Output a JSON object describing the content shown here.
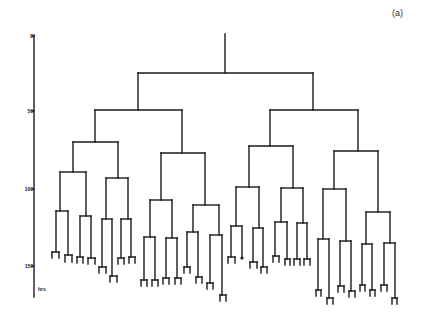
{
  "figure": {
    "panel_label": "(a)",
    "type": "dendrogram",
    "axis": {
      "unit_label": "hrs",
      "ticks": [
        {
          "label": "0",
          "y": 36
        },
        {
          "label": "50",
          "y": 111
        },
        {
          "label": "100",
          "y": 189
        },
        {
          "label": "150",
          "y": 266
        }
      ]
    },
    "line_color": "#1a1a1a",
    "segments": [
      [
        225,
        34,
        225,
        73
      ],
      [
        138,
        73,
        313,
        73
      ],
      [
        138,
        73,
        138,
        110
      ],
      [
        313,
        73,
        313,
        110
      ],
      [
        95,
        110,
        182,
        110
      ],
      [
        95,
        110,
        95,
        142
      ],
      [
        182,
        110,
        182,
        153
      ],
      [
        73,
        142,
        118,
        142
      ],
      [
        73,
        142,
        73,
        172
      ],
      [
        118,
        142,
        118,
        178
      ],
      [
        60,
        172,
        86,
        172
      ],
      [
        60,
        172,
        60,
        211
      ],
      [
        86,
        172,
        86,
        216
      ],
      [
        56,
        211,
        68,
        211
      ],
      [
        56,
        211,
        56,
        252
      ],
      [
        68,
        211,
        68,
        255
      ],
      [
        52,
        252,
        59,
        252
      ],
      [
        52,
        252,
        52,
        258
      ],
      [
        59,
        252,
        59,
        258
      ],
      [
        65,
        255,
        72,
        255
      ],
      [
        65,
        255,
        65,
        262
      ],
      [
        72,
        255,
        72,
        262
      ],
      [
        80,
        216,
        91,
        216
      ],
      [
        80,
        216,
        80,
        257
      ],
      [
        91,
        216,
        91,
        258
      ],
      [
        77,
        257,
        83,
        257
      ],
      [
        77,
        257,
        77,
        263
      ],
      [
        83,
        257,
        83,
        263
      ],
      [
        88,
        258,
        95,
        258
      ],
      [
        88,
        258,
        88,
        264
      ],
      [
        95,
        258,
        95,
        264
      ],
      [
        106,
        178,
        128,
        178
      ],
      [
        106,
        178,
        106,
        219
      ],
      [
        128,
        178,
        128,
        219
      ],
      [
        102,
        219,
        112,
        219
      ],
      [
        102,
        219,
        102,
        267
      ],
      [
        112,
        219,
        112,
        276
      ],
      [
        99,
        267,
        106,
        267
      ],
      [
        99,
        267,
        99,
        273
      ],
      [
        106,
        267,
        106,
        273
      ],
      [
        110,
        276,
        117,
        276
      ],
      [
        110,
        276,
        110,
        282
      ],
      [
        117,
        276,
        117,
        282
      ],
      [
        121,
        219,
        131,
        219
      ],
      [
        121,
        219,
        121,
        258
      ],
      [
        131,
        219,
        131,
        257
      ],
      [
        118,
        258,
        124,
        258
      ],
      [
        118,
        258,
        118,
        264
      ],
      [
        124,
        258,
        124,
        264
      ],
      [
        129,
        257,
        135,
        257
      ],
      [
        129,
        257,
        129,
        263
      ],
      [
        135,
        257,
        135,
        263
      ],
      [
        161,
        153,
        205,
        153
      ],
      [
        161,
        153,
        161,
        200
      ],
      [
        205,
        153,
        205,
        205
      ],
      [
        150,
        200,
        172,
        200
      ],
      [
        150,
        200,
        150,
        237
      ],
      [
        172,
        200,
        172,
        238
      ],
      [
        144,
        237,
        155,
        237
      ],
      [
        144,
        237,
        144,
        280
      ],
      [
        155,
        237,
        155,
        280
      ],
      [
        141,
        280,
        147,
        280
      ],
      [
        141,
        280,
        141,
        286
      ],
      [
        147,
        280,
        147,
        286
      ],
      [
        152,
        280,
        158,
        280
      ],
      [
        152,
        280,
        152,
        286
      ],
      [
        158,
        280,
        158,
        286
      ],
      [
        166,
        238,
        177,
        238
      ],
      [
        166,
        238,
        166,
        278
      ],
      [
        177,
        238,
        177,
        278
      ],
      [
        163,
        278,
        169,
        278
      ],
      [
        163,
        278,
        163,
        284
      ],
      [
        169,
        278,
        169,
        284
      ],
      [
        175,
        278,
        181,
        278
      ],
      [
        175,
        278,
        175,
        284
      ],
      [
        181,
        278,
        181,
        284
      ],
      [
        193,
        205,
        219,
        205
      ],
      [
        193,
        205,
        193,
        232
      ],
      [
        219,
        205,
        219,
        235
      ],
      [
        187,
        232,
        198,
        232
      ],
      [
        187,
        232,
        187,
        267
      ],
      [
        198,
        232,
        198,
        277
      ],
      [
        184,
        267,
        190,
        267
      ],
      [
        184,
        267,
        184,
        273
      ],
      [
        190,
        267,
        190,
        273
      ],
      [
        196,
        277,
        202,
        277
      ],
      [
        196,
        277,
        196,
        283
      ],
      [
        202,
        277,
        202,
        283
      ],
      [
        210,
        235,
        222,
        235
      ],
      [
        210,
        235,
        210,
        283
      ],
      [
        222,
        235,
        222,
        295
      ],
      [
        207,
        283,
        213,
        283
      ],
      [
        207,
        283,
        207,
        289
      ],
      [
        213,
        283,
        213,
        289
      ],
      [
        220,
        295,
        226,
        295
      ],
      [
        220,
        295,
        220,
        301
      ],
      [
        226,
        295,
        226,
        301
      ],
      [
        270,
        110,
        358,
        110
      ],
      [
        270,
        110,
        270,
        146
      ],
      [
        358,
        110,
        358,
        151
      ],
      [
        249,
        146,
        293,
        146
      ],
      [
        249,
        146,
        249,
        187
      ],
      [
        293,
        146,
        293,
        188
      ],
      [
        236,
        187,
        259,
        187
      ],
      [
        236,
        187,
        236,
        226
      ],
      [
        259,
        187,
        259,
        228
      ],
      [
        231,
        226,
        242,
        226
      ],
      [
        231,
        226,
        231,
        257
      ],
      [
        242,
        226,
        242,
        257
      ],
      [
        228,
        257,
        235,
        257
      ],
      [
        228,
        257,
        228,
        263
      ],
      [
        235,
        257,
        235,
        263
      ],
      [
        253,
        228,
        263,
        228
      ],
      [
        253,
        228,
        253,
        262
      ],
      [
        263,
        228,
        263,
        267
      ],
      [
        250,
        262,
        257,
        262
      ],
      [
        250,
        262,
        250,
        268
      ],
      [
        257,
        262,
        257,
        268
      ],
      [
        261,
        267,
        267,
        267
      ],
      [
        261,
        267,
        261,
        273
      ],
      [
        267,
        267,
        267,
        273
      ],
      [
        281,
        188,
        303,
        188
      ],
      [
        281,
        188,
        281,
        222
      ],
      [
        303,
        188,
        303,
        223
      ],
      [
        275,
        222,
        287,
        222
      ],
      [
        275,
        222,
        275,
        256
      ],
      [
        287,
        222,
        287,
        259
      ],
      [
        273,
        256,
        279,
        256
      ],
      [
        273,
        256,
        273,
        262
      ],
      [
        279,
        256,
        279,
        262
      ],
      [
        285,
        259,
        290,
        259
      ],
      [
        285,
        259,
        285,
        265
      ],
      [
        290,
        259,
        290,
        265
      ],
      [
        297,
        223,
        307,
        223
      ],
      [
        297,
        223,
        297,
        259
      ],
      [
        307,
        223,
        307,
        259
      ],
      [
        294,
        259,
        300,
        259
      ],
      [
        294,
        259,
        294,
        265
      ],
      [
        300,
        259,
        300,
        265
      ],
      [
        304,
        259,
        310,
        259
      ],
      [
        304,
        259,
        304,
        265
      ],
      [
        310,
        259,
        310,
        265
      ],
      [
        334,
        151,
        378,
        151
      ],
      [
        334,
        151,
        334,
        189
      ],
      [
        378,
        151,
        378,
        212
      ],
      [
        323,
        189,
        346,
        189
      ],
      [
        323,
        189,
        323,
        239
      ],
      [
        346,
        189,
        346,
        241
      ],
      [
        318,
        239,
        329,
        239
      ],
      [
        318,
        239,
        318,
        290
      ],
      [
        329,
        239,
        329,
        298
      ],
      [
        316,
        290,
        321,
        290
      ],
      [
        316,
        290,
        316,
        296
      ],
      [
        321,
        290,
        321,
        296
      ],
      [
        327,
        298,
        333,
        298
      ],
      [
        327,
        298,
        327,
        304
      ],
      [
        333,
        298,
        333,
        304
      ],
      [
        340,
        241,
        351,
        241
      ],
      [
        340,
        241,
        340,
        286
      ],
      [
        351,
        241,
        351,
        291
      ],
      [
        338,
        286,
        344,
        286
      ],
      [
        338,
        286,
        338,
        292
      ],
      [
        344,
        286,
        344,
        292
      ],
      [
        349,
        291,
        355,
        291
      ],
      [
        349,
        291,
        349,
        297
      ],
      [
        355,
        291,
        355,
        297
      ],
      [
        366,
        212,
        390,
        212
      ],
      [
        366,
        212,
        366,
        244
      ],
      [
        390,
        212,
        390,
        243
      ],
      [
        362,
        244,
        372,
        244
      ],
      [
        362,
        244,
        362,
        285
      ],
      [
        372,
        244,
        372,
        290
      ],
      [
        360,
        285,
        365,
        285
      ],
      [
        360,
        285,
        360,
        291
      ],
      [
        365,
        285,
        365,
        291
      ],
      [
        370,
        290,
        375,
        290
      ],
      [
        370,
        290,
        370,
        296
      ],
      [
        375,
        290,
        375,
        296
      ],
      [
        384,
        243,
        395,
        243
      ],
      [
        384,
        243,
        384,
        285
      ],
      [
        395,
        243,
        395,
        298
      ],
      [
        381,
        285,
        387,
        285
      ],
      [
        381,
        285,
        381,
        291
      ],
      [
        387,
        285,
        387,
        291
      ],
      [
        392,
        298,
        397,
        298
      ],
      [
        392,
        298,
        392,
        304
      ],
      [
        397,
        298,
        397,
        304
      ]
    ],
    "dots": [
      [
        242,
        258
      ]
    ]
  }
}
